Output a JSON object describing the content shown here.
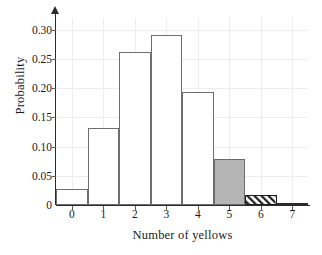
{
  "chart_data": {
    "type": "bar",
    "title": "",
    "subtitle": "",
    "xlabel": "Number of yellows",
    "ylabel": "Probability",
    "categories": [
      "0",
      "1",
      "2",
      "3",
      "4",
      "5",
      "6",
      "7"
    ],
    "values": [
      0.028,
      0.131,
      0.262,
      0.291,
      0.193,
      0.078,
      0.018,
      0.002
    ],
    "series": [
      {
        "name": "Probability",
        "values": [
          0.028,
          0.131,
          0.262,
          0.291,
          0.193,
          0.078,
          0.018,
          0.002
        ]
      }
    ],
    "bar_styles": [
      "open",
      "open",
      "open",
      "open",
      "open",
      "solid-gray",
      "hatched",
      "solid-dark"
    ],
    "xlim": [
      -0.5,
      7.5
    ],
    "ylim": [
      0,
      0.32
    ],
    "ytick_values": [
      0,
      0.05,
      0.1,
      0.15,
      0.2,
      0.25,
      0.3
    ],
    "ytick_labels": [
      "0",
      "0.05",
      "0.10",
      "0.15",
      "0.20",
      "0.25",
      "0.30"
    ],
    "xtick_labels": [
      "0",
      "1",
      "2",
      "3",
      "4",
      "5",
      "6",
      "7"
    ],
    "grid": true,
    "legend": "none",
    "annotations": [],
    "colors": {
      "bar_outline": "#6e6e6e",
      "bar_fill_open": "#ffffff",
      "bar_fill_highlight": "#b5b5b5",
      "hatch_color": "#1f1f1f",
      "axis": "#2b2b2b",
      "grid": "#ededed",
      "text": "#1a1a1a"
    }
  }
}
